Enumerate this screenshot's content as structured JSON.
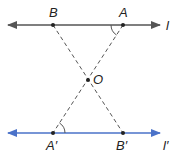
{
  "diagram": {
    "points": {
      "B": {
        "label": "B",
        "x": 53,
        "y": 25
      },
      "A": {
        "label": "A",
        "x": 123,
        "y": 25
      },
      "O": {
        "label": "O",
        "x": 88,
        "y": 80
      },
      "A_prime": {
        "label": "A′",
        "x": 53,
        "y": 133
      },
      "B_prime": {
        "label": "B′",
        "x": 123,
        "y": 133
      }
    },
    "lines": {
      "top": {
        "label": "l",
        "color": "#555555"
      },
      "bottom": {
        "label": "l′",
        "color": "#4a72c9"
      }
    },
    "dashed_segments": [
      "B–B′",
      "A–A′"
    ],
    "angle_marks": [
      "angle at A",
      "angle at A′"
    ]
  }
}
